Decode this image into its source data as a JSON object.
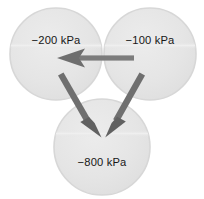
{
  "diagram": {
    "type": "water-potential-cell-diagram",
    "background_color": "#ffffff",
    "cells": [
      {
        "id": "cell-left",
        "label": "−200 kPa",
        "value": -200,
        "unit": "kPa",
        "cx": 56,
        "cy": 54,
        "r": 46,
        "fill": "#e4e4e4",
        "stroke": "#d6d6d6"
      },
      {
        "id": "cell-right",
        "label": "−100 kPa",
        "value": -100,
        "unit": "kPa",
        "cx": 150,
        "cy": 54,
        "r": 46,
        "fill": "#e4e4e4",
        "stroke": "#d6d6d6"
      },
      {
        "id": "cell-bottom",
        "label": "−800 kPa",
        "value": -800,
        "unit": "kPa",
        "cx": 102,
        "cy": 147,
        "r": 48,
        "fill": "#e4e4e4",
        "stroke": "#d6d6d6"
      }
    ],
    "arrows": [
      {
        "id": "arrow-right-to-left",
        "from": "cell-right",
        "to": "cell-left",
        "direction": "left",
        "color": "#797979"
      },
      {
        "id": "arrow-left-to-bottom",
        "from": "cell-left",
        "to": "cell-bottom",
        "direction": "down-right",
        "color": "#6f6f6f"
      },
      {
        "id": "arrow-right-to-bottom",
        "from": "cell-right",
        "to": "cell-bottom",
        "direction": "down-left",
        "color": "#6f6f6f"
      }
    ]
  }
}
